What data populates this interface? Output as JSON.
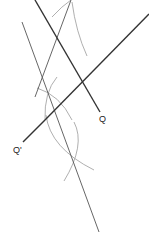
{
  "diagram": {
    "type": "geometric-construction",
    "labels": {
      "q": "Q",
      "q_prime": "Q'"
    },
    "colors": {
      "background": "#ffffff",
      "thick_line": "#333333",
      "thin_line": "#555555",
      "arc": "#9a9a9a",
      "label": "#222222"
    },
    "lines": [
      {
        "name": "line-to-q",
        "x1": 35,
        "y1": 0,
        "x2": 100,
        "y2": 112,
        "weight": "thick"
      },
      {
        "name": "line-through-q-prime",
        "x1": 149,
        "y1": 14,
        "x2": 45,
        "y2": 120,
        "weight": "thick"
      },
      {
        "name": "perpendicular-line",
        "x1": 22,
        "y1": 22,
        "x2": 99,
        "y2": 232,
        "weight": "thin"
      },
      {
        "name": "apex-line",
        "x1": 71,
        "y1": 0,
        "x2": 35,
        "y2": 97,
        "weight": "thin"
      }
    ]
  }
}
